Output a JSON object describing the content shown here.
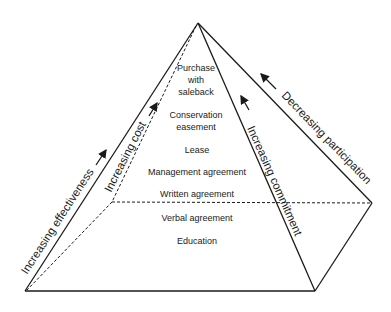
{
  "diagram": {
    "type": "pyramid",
    "levels": [
      "Purchase",
      "with",
      "saleback",
      "Conservation",
      "easement",
      "Lease",
      "Management agreement",
      "Written agreement",
      "Verbal agreement",
      "Education"
    ],
    "level_items": [
      {
        "label": "Purchase with saleback"
      },
      {
        "label": "Conservation easement"
      },
      {
        "label": "Lease"
      },
      {
        "label": "Management agreement"
      },
      {
        "label": "Written agreement"
      },
      {
        "label": "Verbal agreement"
      },
      {
        "label": "Education"
      }
    ],
    "axes": {
      "effectiveness": "Increasing effectiveness",
      "cost": "Increasing cost",
      "commitment": "Increasing commitment",
      "participation": "Decreasing participation"
    },
    "colors": {
      "line": "#1a1a1a",
      "background": "#ffffff"
    }
  }
}
